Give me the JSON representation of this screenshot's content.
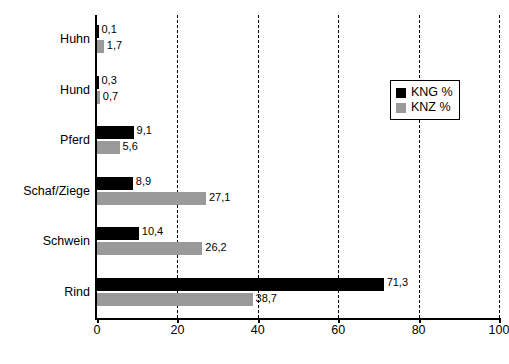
{
  "chart_data": {
    "type": "bar",
    "orientation": "horizontal",
    "title": "",
    "xlabel": "",
    "ylabel": "",
    "xlim": [
      0,
      100
    ],
    "xticks": [
      "0",
      "20",
      "40",
      "60",
      "80",
      "100"
    ],
    "grid": true,
    "legend_position": "top-right",
    "categories": [
      "Huhn",
      "Hund",
      "Pferd",
      "Schaf/Ziege",
      "Schwein",
      "Rind"
    ],
    "series": [
      {
        "name": "KNG %",
        "color": "#000000",
        "values": [
          0.1,
          0.3,
          9.1,
          8.9,
          10.4,
          71.3
        ],
        "labels": [
          "0,1",
          "0,3",
          "9,1",
          "8,9",
          "10,4",
          "71,3"
        ]
      },
      {
        "name": "KNZ %",
        "color": "#9a9a9a",
        "values": [
          1.7,
          0.7,
          5.6,
          27.1,
          26.2,
          38.7
        ],
        "labels": [
          "1,7",
          "0,7",
          "5,6",
          "27,1",
          "26,2",
          "38,7"
        ]
      }
    ]
  },
  "legend": {
    "items": [
      {
        "label": "KNG %",
        "color": "#000000"
      },
      {
        "label": "KNZ %",
        "color": "#9a9a9a"
      }
    ]
  }
}
